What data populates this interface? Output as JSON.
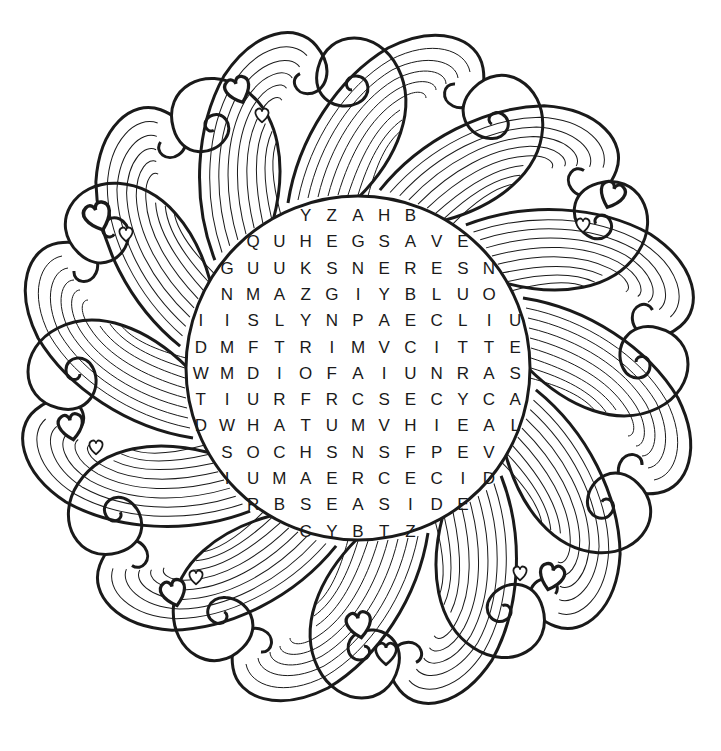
{
  "puzzle": {
    "type": "word-search",
    "theme_visual": "sun with wavy swirl rays and hearts",
    "colors": {
      "ink": "#1a1a1a",
      "background": "#ffffff"
    },
    "grid": {
      "center_x": 358,
      "row_y_start": 216,
      "row_height": 26.3,
      "col_width": 26.2,
      "rows": [
        {
          "offset": -2,
          "letters": [
            "Y",
            "Z",
            "A",
            "H",
            "B"
          ]
        },
        {
          "offset": -4,
          "letters": [
            "Q",
            "U",
            "H",
            "E",
            "G",
            "S",
            "A",
            "V",
            "E"
          ]
        },
        {
          "offset": -5,
          "letters": [
            "G",
            "U",
            "U",
            "K",
            "S",
            "N",
            "E",
            "R",
            "E",
            "S",
            "N"
          ]
        },
        {
          "offset": -5,
          "letters": [
            "N",
            "M",
            "A",
            "Z",
            "G",
            "I",
            "Y",
            "B",
            "L",
            "U",
            "O"
          ]
        },
        {
          "offset": -6,
          "letters": [
            "I",
            "I",
            "S",
            "L",
            "Y",
            "N",
            "P",
            "A",
            "E",
            "C",
            "L",
            "I",
            "U"
          ]
        },
        {
          "offset": -6,
          "letters": [
            "D",
            "M",
            "F",
            "T",
            "R",
            "I",
            "M",
            "V",
            "C",
            "I",
            "T",
            "T",
            "E"
          ]
        },
        {
          "offset": -6,
          "letters": [
            "W",
            "M",
            "D",
            "I",
            "O",
            "F",
            "A",
            "I",
            "U",
            "N",
            "R",
            "A",
            "S"
          ]
        },
        {
          "offset": -6,
          "letters": [
            "T",
            "I",
            "U",
            "R",
            "F",
            "R",
            "C",
            "S",
            "E",
            "C",
            "Y",
            "C",
            "A"
          ]
        },
        {
          "offset": -6,
          "letters": [
            "D",
            "W",
            "H",
            "A",
            "T",
            "U",
            "M",
            "V",
            "H",
            "I",
            "E",
            "A",
            "L"
          ]
        },
        {
          "offset": -5,
          "letters": [
            "S",
            "O",
            "C",
            "H",
            "S",
            "N",
            "S",
            "F",
            "P",
            "E",
            "V"
          ]
        },
        {
          "offset": -5,
          "letters": [
            "I",
            "U",
            "M",
            "A",
            "E",
            "R",
            "C",
            "E",
            "C",
            "I",
            "D"
          ]
        },
        {
          "offset": -4,
          "letters": [
            "R",
            "B",
            "S",
            "E",
            "A",
            "S",
            "I",
            "D",
            "E"
          ]
        },
        {
          "offset": -2,
          "letters": [
            "C",
            "Y",
            "B",
            "T",
            "Z"
          ]
        }
      ]
    }
  }
}
